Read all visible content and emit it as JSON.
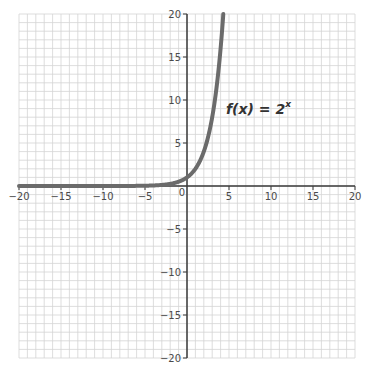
{
  "chart_data": {
    "type": "line",
    "title": "",
    "xlabel": "",
    "ylabel": "",
    "xlim": [
      -20,
      20
    ],
    "ylim": [
      -20,
      20
    ],
    "grid": true,
    "minor_grid_step": 1,
    "major_tick_step": 5,
    "x_ticks": [
      -20,
      -15,
      -10,
      -5,
      0,
      5,
      10,
      15,
      20
    ],
    "y_ticks": [
      -20,
      -15,
      -10,
      -5,
      5,
      10,
      15,
      20
    ],
    "x_tick_labels": [
      "−20",
      "−15",
      "−10",
      "−5",
      "0",
      "5",
      "10",
      "15",
      "20"
    ],
    "y_tick_labels": [
      "−20",
      "−15",
      "−10",
      "−5",
      "5",
      "10",
      "15",
      "20"
    ],
    "series": [
      {
        "name": "f(x) = 2^x",
        "function": "2^x",
        "x": [
          -20,
          -10,
          -5,
          -4,
          -3,
          -2,
          -1,
          0,
          1,
          2,
          3,
          3.5,
          4,
          4.32
        ],
        "y": [
          1e-06,
          0.001,
          0.03125,
          0.0625,
          0.125,
          0.25,
          0.5,
          1,
          2,
          4,
          8,
          11.31,
          16,
          20
        ],
        "color": "#6b6b6b"
      }
    ],
    "annotations": [
      {
        "text_main": "f(x) = 2",
        "superscript": "x",
        "x": 5,
        "y": 10
      }
    ]
  },
  "colors": {
    "grid": "#d4d4d4",
    "axis": "#3a3a3a",
    "curve": "#6b6b6b",
    "text": "#4a4a4a"
  }
}
